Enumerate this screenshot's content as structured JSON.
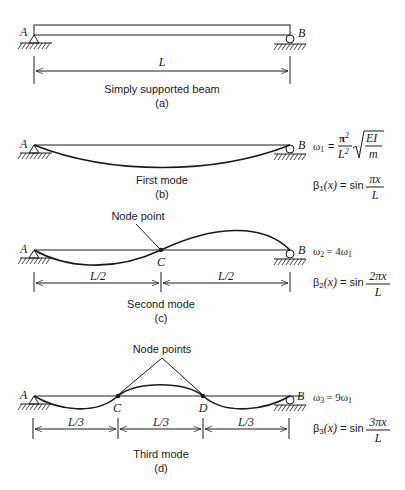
{
  "colors": {
    "ink": "#1a1a1a",
    "background": "#ffffff"
  },
  "labels": {
    "A": "A",
    "B": "B",
    "C": "C",
    "D": "D",
    "L": "L",
    "L_half": "L/2",
    "L_third": "L/3",
    "node_point": "Node point",
    "node_points": "Node points"
  },
  "panels": {
    "a": {
      "caption": "Simply supported beam",
      "tag": "(a)"
    },
    "b": {
      "caption": "First mode",
      "tag": "(b)",
      "omega": {
        "lhs": "ω",
        "sub": "1",
        "eq": "=",
        "num": "π",
        "num_sup": "2",
        "den": "L",
        "den_sup": "2",
        "rad_num": "EI",
        "rad_den": "m"
      },
      "beta": {
        "lhs": "β",
        "sub": "1",
        "arg": "(x)",
        "eq": "= sin",
        "num": "πx",
        "den": "L"
      }
    },
    "c": {
      "caption": "Second mode",
      "tag": "(c)",
      "omega": {
        "lhs": "ω",
        "sub": "2",
        "rhs": "= 4ω",
        "rhs_sub": "1"
      },
      "beta": {
        "lhs": "β",
        "sub": "2",
        "arg": "(x)",
        "eq": "= sin",
        "num": "2πx",
        "den": "L"
      }
    },
    "d": {
      "caption": "Third mode",
      "tag": "(d)",
      "omega": {
        "lhs": "ω",
        "sub": "3",
        "rhs": "= 9ω",
        "rhs_sub": "1"
      },
      "beta": {
        "lhs": "β",
        "sub": "3",
        "arg": "(x)",
        "eq": "= sin",
        "num": "3πx",
        "den": "L"
      }
    }
  }
}
